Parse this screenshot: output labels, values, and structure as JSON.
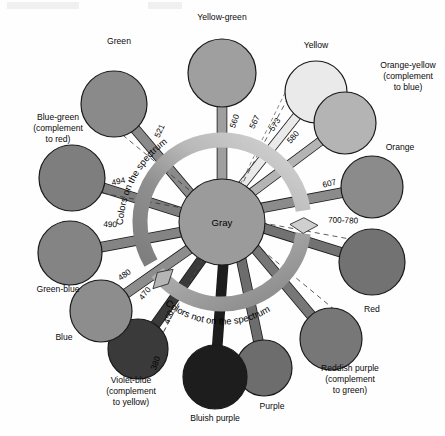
{
  "diagram": {
    "hub_label": "Gray",
    "ring_label_upper": "Colors on the spectrum",
    "ring_label_lower": "Colors not on the spectrum",
    "background_color": "#fefefe",
    "hub_color": "#9b9b9b",
    "ring_color_light": "#cccccc",
    "ring_color_dark": "#7a7a7a",
    "outline_color": "#1a1a1a"
  },
  "chart_data": {
    "type": "pie",
    "center_label": "Gray",
    "annotations": [
      "Colors on the spectrum",
      "Colors not on the spectrum"
    ],
    "legend_position": "around",
    "categories": [
      "Yellow-green",
      "Yellow",
      "Orange-yellow (complement to blue)",
      "Orange",
      "Red",
      "Reddish purple (complement to green)",
      "Purple",
      "Bluish purple",
      "Violet-blue (complement to yellow)",
      "Blue",
      "Green-blue",
      "Blue-green (complement to red)",
      "Green"
    ],
    "values": [
      560,
      573,
      580,
      607,
      740,
      null,
      null,
      null,
      420,
      475,
      490,
      494,
      521
    ],
    "xlabel": "hue",
    "ylabel": "wavelength (nm)"
  },
  "hues": [
    {
      "name": "Yellow-green",
      "label": "Yellow-green",
      "wavelength": "560",
      "color": "#9f9f9f",
      "angle": -90,
      "cx": 222,
      "cy": 73,
      "r": 34,
      "label_x": 222,
      "label_y": 20,
      "label_anchor": "middle",
      "wl_x": 237,
      "wl_y": 122,
      "wl_rot": -70,
      "spoke_w": 9,
      "complement": ""
    },
    {
      "name": "Yellow",
      "label": "Yellow",
      "wavelength": "573",
      "color": "#eaeaea",
      "angle": -62,
      "cx": 316,
      "cy": 92,
      "r": 31,
      "label_x": 316,
      "label_y": 48,
      "label_anchor": "middle",
      "wl_x": 277,
      "wl_y": 126,
      "wl_rot": -56,
      "spoke_w": 8,
      "complement": ""
    },
    {
      "name": "Orange-yellow",
      "label": "Orange-yellow",
      "wavelength": "580",
      "color": "#b4b4b4",
      "angle": -45,
      "cx": 345,
      "cy": 123,
      "r": 31,
      "label_x": 408,
      "label_y": 68,
      "label_anchor": "middle",
      "wl_x": 295,
      "wl_y": 139,
      "wl_rot": -48,
      "spoke_w": 8,
      "complement": "(complement\nto blue)"
    },
    {
      "name": "Orange",
      "label": "Orange",
      "wavelength": "607",
      "color": "#8b8b8b",
      "angle": -20,
      "cx": 372,
      "cy": 187,
      "r": 31,
      "label_x": 400,
      "label_y": 150,
      "label_anchor": "middle",
      "wl_x": 330,
      "wl_y": 186,
      "wl_rot": -14,
      "spoke_w": 9,
      "complement": ""
    },
    {
      "name": "Red",
      "label": "Red",
      "wavelength": "700-780",
      "color": "#727272",
      "angle": 8,
      "cx": 372,
      "cy": 262,
      "r": 33,
      "label_x": 372,
      "label_y": 312,
      "label_anchor": "middle",
      "wl_x": 343,
      "wl_y": 223,
      "wl_rot": 2,
      "spoke_w": 9,
      "complement": ""
    },
    {
      "name": "Reddish purple",
      "label": "Reddish purple",
      "wavelength": "",
      "color": "#777777",
      "angle": 38,
      "cx": 331,
      "cy": 339,
      "r": 31,
      "label_x": 350,
      "label_y": 371,
      "label_anchor": "middle",
      "wl_x": 0,
      "wl_y": 0,
      "wl_rot": 0,
      "spoke_w": 9,
      "complement": "(complement\nto green)"
    },
    {
      "name": "Purple",
      "label": "Purple",
      "wavelength": "",
      "color": "#6d6d6d",
      "angle": 62,
      "cx": 264,
      "cy": 368,
      "r": 28,
      "label_x": 272,
      "label_y": 409,
      "label_anchor": "middle",
      "wl_x": 0,
      "wl_y": 0,
      "wl_rot": 0,
      "spoke_w": 9,
      "complement": ""
    },
    {
      "name": "Bluish purple",
      "label": "Bluish purple",
      "wavelength": "",
      "color": "#1d1d1d",
      "angle": 88,
      "cx": 215,
      "cy": 377,
      "r": 32,
      "label_x": 215,
      "label_y": 421,
      "label_anchor": "middle",
      "wl_x": 0,
      "wl_y": 0,
      "wl_rot": 0,
      "spoke_w": 9,
      "complement": ""
    },
    {
      "name": "Violet-blue",
      "label": "Violet-blue",
      "wavelength": "450",
      "color": "#3a3a3a",
      "angle": 118,
      "cx": 138,
      "cy": 349,
      "r": 30,
      "label_x": 131,
      "label_y": 383,
      "label_anchor": "middle",
      "wl_x": 171,
      "wl_y": 318,
      "wl_rot": -68,
      "spoke_w": 9,
      "complement": "(complement\nto yellow)"
    },
    {
      "name": "Blue",
      "label": "Blue",
      "wavelength": "470",
      "color": "#8d8d8d",
      "angle": 140,
      "cx": 101,
      "cy": 311,
      "r": 31,
      "label_x": 64,
      "label_y": 340,
      "label_anchor": "middle",
      "wl_x": 147,
      "wl_y": 295,
      "wl_rot": -52,
      "spoke_w": 9,
      "complement": ""
    },
    {
      "name": "Green-blue",
      "label": "Green-blue",
      "wavelength": "490",
      "color": "#848484",
      "angle": 166,
      "cx": 70,
      "cy": 253,
      "r": 32,
      "label_x": 58,
      "label_y": 292,
      "label_anchor": "middle",
      "wl_x": 110,
      "wl_y": 227,
      "wl_rot": 3,
      "spoke_w": 9,
      "complement": ""
    },
    {
      "name": "Blue-green",
      "label": "Blue-green",
      "wavelength": "494",
      "color": "#7e7e7e",
      "angle": 193,
      "cx": 72,
      "cy": 178,
      "r": 33,
      "label_x": 58,
      "label_y": 120,
      "label_anchor": "middle",
      "wl_x": 119,
      "wl_y": 184,
      "wl_rot": -13,
      "spoke_w": 9,
      "complement": "(complement\nto red)"
    },
    {
      "name": "Green",
      "label": "Green",
      "wavelength": "521",
      "color": "#8a8a8a",
      "angle": 221,
      "cx": 114,
      "cy": 104,
      "r": 33,
      "label_x": 119,
      "label_y": 44,
      "label_anchor": "middle",
      "wl_x": 162,
      "wl_y": 132,
      "wl_rot": -66,
      "spoke_w": 9,
      "complement": ""
    }
  ],
  "extra_wavelengths": [
    {
      "value": "567",
      "x": 257,
      "y": 123,
      "rot": -64
    },
    {
      "value": "480",
      "x": 126,
      "y": 277,
      "rot": -36
    },
    {
      "value": "380",
      "x": 158,
      "y": 364,
      "rot": -70
    }
  ]
}
